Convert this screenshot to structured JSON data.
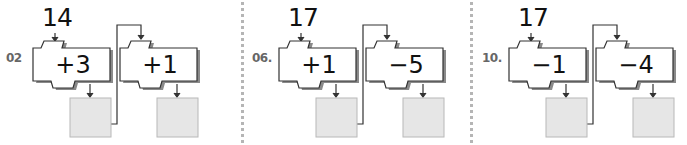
{
  "problems": [
    {
      "label": "02",
      "start": "14",
      "ops": [
        "+3",
        "+1"
      ],
      "answers": [
        "",
        ""
      ]
    },
    {
      "label": "06.",
      "start": "17",
      "ops": [
        "+1",
        "−5"
      ],
      "answers": [
        "",
        ""
      ]
    },
    {
      "label": "10.",
      "start": "17",
      "ops": [
        "−1",
        "−4"
      ],
      "answers": [
        "",
        ""
      ]
    }
  ],
  "colors": {
    "answer_box": "#e6e6e6",
    "answer_border": "#b8b8b8",
    "machine_shadow": "#8a8a8a",
    "divider": "#b5b5b5"
  }
}
